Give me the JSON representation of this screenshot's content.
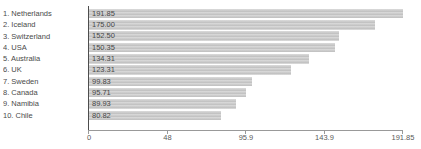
{
  "chart_data": {
    "type": "bar",
    "orientation": "horizontal",
    "title": "",
    "xlabel": "",
    "ylabel": "",
    "grid": false,
    "legend": false,
    "xlim": [
      0,
      191.85
    ],
    "categories": [
      "1. Netherlands",
      "2. Iceland",
      "3. Switzerland",
      "4. USA",
      "5. Australia",
      "6. UK",
      "7. Sweden",
      "8. Canada",
      "9. Namibia",
      "10. Chile"
    ],
    "values": [
      191.85,
      175.0,
      152.5,
      150.35,
      134.31,
      123.31,
      99.83,
      95.71,
      89.93,
      80.82
    ],
    "items": [
      {
        "label": "1. Netherlands",
        "value": 191.85,
        "value_label": "191.85"
      },
      {
        "label": "2. Iceland",
        "value": 175.0,
        "value_label": "175.00"
      },
      {
        "label": "3. Switzerland",
        "value": 152.5,
        "value_label": "152.50"
      },
      {
        "label": "4. USA",
        "value": 150.35,
        "value_label": "150.35"
      },
      {
        "label": "5. Australia",
        "value": 134.31,
        "value_label": "134.31"
      },
      {
        "label": "6. UK",
        "value": 123.31,
        "value_label": "123.31"
      },
      {
        "label": "7. Sweden",
        "value": 99.83,
        "value_label": "99.83"
      },
      {
        "label": "8. Canada",
        "value": 95.71,
        "value_label": "95.71"
      },
      {
        "label": "9. Namibia",
        "value": 89.93,
        "value_label": "89.93"
      },
      {
        "label": "10. Chile",
        "value": 80.82,
        "value_label": "80.82"
      }
    ],
    "x_ticks": [
      {
        "label": "0",
        "fraction": 0
      },
      {
        "label": "48",
        "fraction": 0.25
      },
      {
        "label": "95.9",
        "fraction": 0.5
      },
      {
        "label": "143.9",
        "fraction": 0.75
      },
      {
        "label": "191.85",
        "fraction": 1
      }
    ],
    "colors": {
      "bar_fill": "#c9c9c9",
      "value_text": "#474747",
      "category_text": "#4a4a4a",
      "tick_text": "#5a5a5a",
      "y_axis_line": "#4d4d4d",
      "x_axis_line": "#999999",
      "background": "#ffffff"
    }
  }
}
